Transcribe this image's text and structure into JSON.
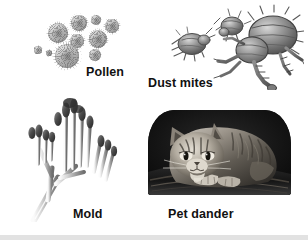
{
  "figure": {
    "background_color": "#ffffff",
    "width": 308,
    "height": 242,
    "rule_color": "#e2e2e2"
  },
  "panels": [
    {
      "id": "pollen",
      "label": "Pollen",
      "art_kind": "illustration",
      "description": "Cluster of round, spiky pollen grains of varying sizes",
      "label_x": 86,
      "label_y": 66
    },
    {
      "id": "dust-mites",
      "label": "Dust mites",
      "art_kind": "illustration",
      "description": "Three dust mites, one large in front and two smaller behind, with bristles and jointed legs",
      "label_x": 148,
      "label_y": 77
    },
    {
      "id": "mold",
      "label": "Mold",
      "art_kind": "illustration",
      "description": "Branching mold stalks topped with club-shaped spore heads",
      "label_x": 73,
      "label_y": 208
    },
    {
      "id": "pet-dander",
      "label": "Pet dander",
      "art_kind": "photograph",
      "description": "Black-and-white photograph of a tabby cat lying curled on a dark cushion",
      "label_x": 168,
      "label_y": 208
    }
  ],
  "pollen_grains": [
    {
      "cx": 36,
      "cy": 25,
      "r": 10
    },
    {
      "cx": 57,
      "cy": 15,
      "r": 8
    },
    {
      "cx": 74,
      "cy": 12,
      "r": 5
    },
    {
      "cx": 90,
      "cy": 18,
      "r": 7
    },
    {
      "cx": 55,
      "cy": 33,
      "r": 7
    },
    {
      "cx": 76,
      "cy": 31,
      "r": 9
    },
    {
      "cx": 16,
      "cy": 42,
      "r": 4
    },
    {
      "cx": 27,
      "cy": 45,
      "r": 3
    },
    {
      "cx": 45,
      "cy": 48,
      "r": 12
    },
    {
      "cx": 73,
      "cy": 47,
      "r": 6
    }
  ],
  "colors": {
    "text": "#111111",
    "pollen_mid": "#9a9a9a",
    "mite_body": "#6e6e6e",
    "mold_stalk": "#b9b9b9",
    "photo_dark": "#0b0b0b"
  }
}
